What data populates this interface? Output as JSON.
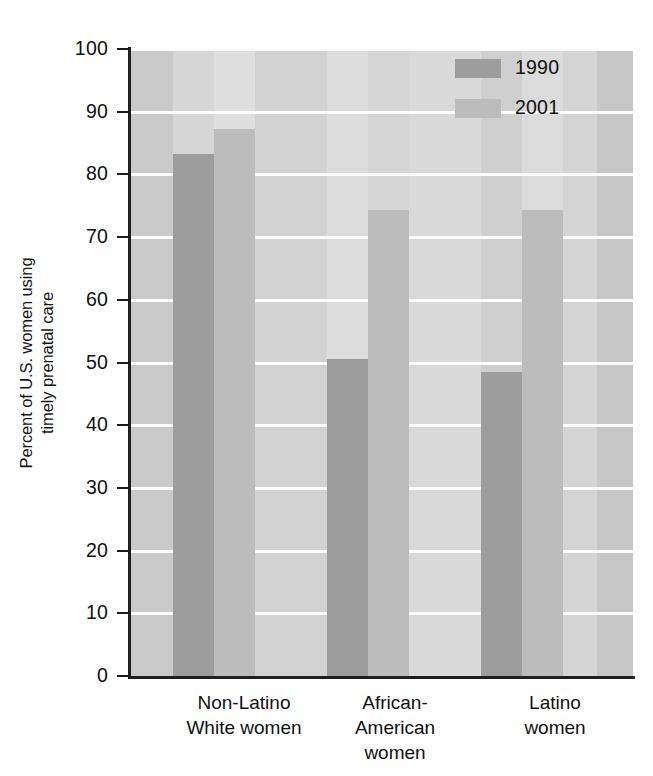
{
  "chart_data": {
    "type": "bar",
    "title": "",
    "subtitle": "",
    "xlabel": "",
    "ylabel": "Percent of U.S. women using timely prenatal care",
    "ylabel_line1": "Percent of U.S. women using",
    "ylabel_line2": "timely prenatal care",
    "ylim": [
      0,
      100
    ],
    "ytick_values": [
      0,
      10,
      20,
      30,
      40,
      50,
      60,
      70,
      80,
      90,
      100
    ],
    "ytick_labels": [
      "0",
      "10",
      "20",
      "30",
      "40",
      "50",
      "60",
      "70",
      "80",
      "90",
      "100"
    ],
    "grid": "horizontal",
    "legend_position": "top-right",
    "categories": [
      "Non-Latino White women",
      "African-American women",
      "Latino women"
    ],
    "category_label_lines": [
      [
        "Non-Latino",
        "White women"
      ],
      [
        "African-",
        "American",
        "women"
      ],
      [
        "Latino",
        "women"
      ]
    ],
    "series": [
      {
        "name": "1990",
        "color": "#9d9d9d",
        "values": [
          83.2,
          50.5,
          48.5
        ]
      },
      {
        "name": "2001",
        "color": "#bcbcbc",
        "values": [
          87.3,
          74.4,
          74.4
        ]
      }
    ],
    "colors": {
      "plot_background": "#d8d8d8",
      "gridline": "#fdfdfd",
      "axis": "#1f1f1f",
      "series_1990": "#9d9d9d",
      "series_2001": "#bcbcbc",
      "text": "#101010"
    }
  },
  "legend": {
    "items": [
      {
        "label": "1990",
        "swatch": "#9d9d9d"
      },
      {
        "label": "2001",
        "swatch": "#bcbcbc"
      }
    ]
  },
  "axis": {
    "y": {
      "label_line1": "Percent of U.S. women using",
      "label_line2": "timely prenatal care",
      "ticks": [
        "100",
        "90",
        "80",
        "70",
        "60",
        "50",
        "40",
        "30",
        "20",
        "10",
        "0"
      ]
    },
    "x": {
      "groups": [
        {
          "line1": "Non-Latino",
          "line2": "White women",
          "line3": ""
        },
        {
          "line1": "African-",
          "line2": "American",
          "line3": "women"
        },
        {
          "line1": "Latino",
          "line2": "women",
          "line3": ""
        }
      ]
    }
  }
}
